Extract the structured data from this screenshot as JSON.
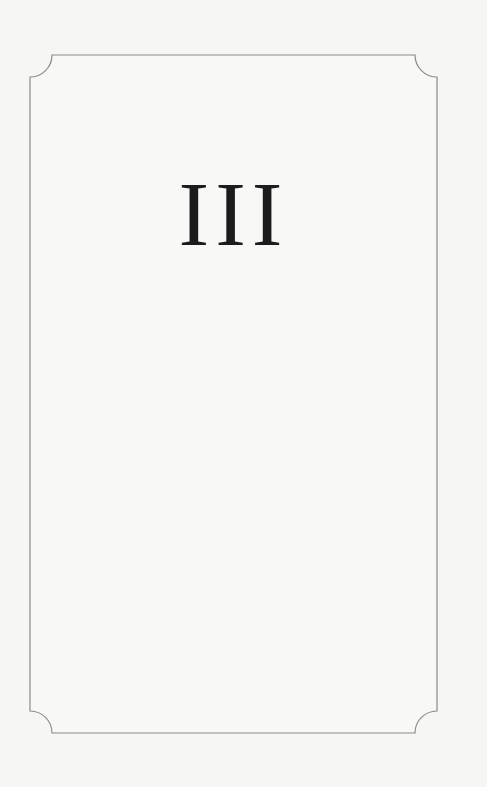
{
  "page": {
    "chapter_numeral": "III",
    "colors": {
      "background": "#f6f6f4",
      "frame_stroke": "#8a8a8a",
      "text": "#1c1c1c"
    }
  }
}
